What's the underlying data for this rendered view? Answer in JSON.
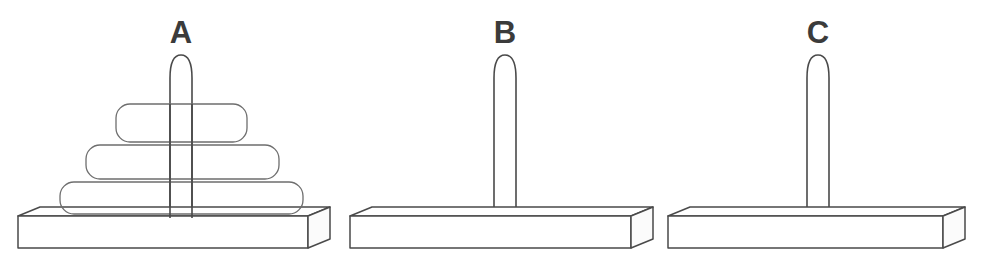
{
  "diagram": {
    "type": "tower-of-hanoi",
    "background_color": "#ffffff",
    "line_color": "#4a4a4a",
    "label_color": "#3b3b3b",
    "canvas": {
      "width": 989,
      "height": 274
    }
  },
  "pegs": [
    {
      "id": "A",
      "label": "A",
      "label_x": 181,
      "label_y": 33,
      "center_x": 181,
      "peg_top_y": 55,
      "peg_bottom_y": 218,
      "peg_half_width": 11,
      "base": {
        "left": 18,
        "right": 330,
        "top_front_y": 216,
        "bottom_y": 248,
        "depth_x": 22,
        "depth_y": 9
      },
      "disk_count": 3,
      "disks": [
        {
          "index": 1,
          "size": "small",
          "left": 116,
          "right": 247,
          "top": 104,
          "bottom": 142,
          "radius": 14
        },
        {
          "index": 2,
          "size": "medium",
          "left": 86,
          "right": 279,
          "top": 145,
          "bottom": 179,
          "radius": 14
        },
        {
          "index": 3,
          "size": "large",
          "left": 60,
          "right": 303,
          "top": 182,
          "bottom": 214,
          "radius": 14
        }
      ]
    },
    {
      "id": "B",
      "label": "B",
      "label_x": 505,
      "label_y": 33,
      "center_x": 505,
      "peg_top_y": 55,
      "peg_bottom_y": 218,
      "peg_half_width": 11,
      "base": {
        "left": 350,
        "right": 653,
        "top_front_y": 216,
        "bottom_y": 248,
        "depth_x": 22,
        "depth_y": 9
      },
      "disk_count": 0,
      "disks": []
    },
    {
      "id": "C",
      "label": "C",
      "label_x": 818,
      "label_y": 33,
      "center_x": 818,
      "peg_top_y": 55,
      "peg_bottom_y": 218,
      "peg_half_width": 11,
      "base": {
        "left": 668,
        "right": 965,
        "top_front_y": 216,
        "bottom_y": 248,
        "depth_x": 22,
        "depth_y": 9
      },
      "disk_count": 0,
      "disks": []
    }
  ]
}
